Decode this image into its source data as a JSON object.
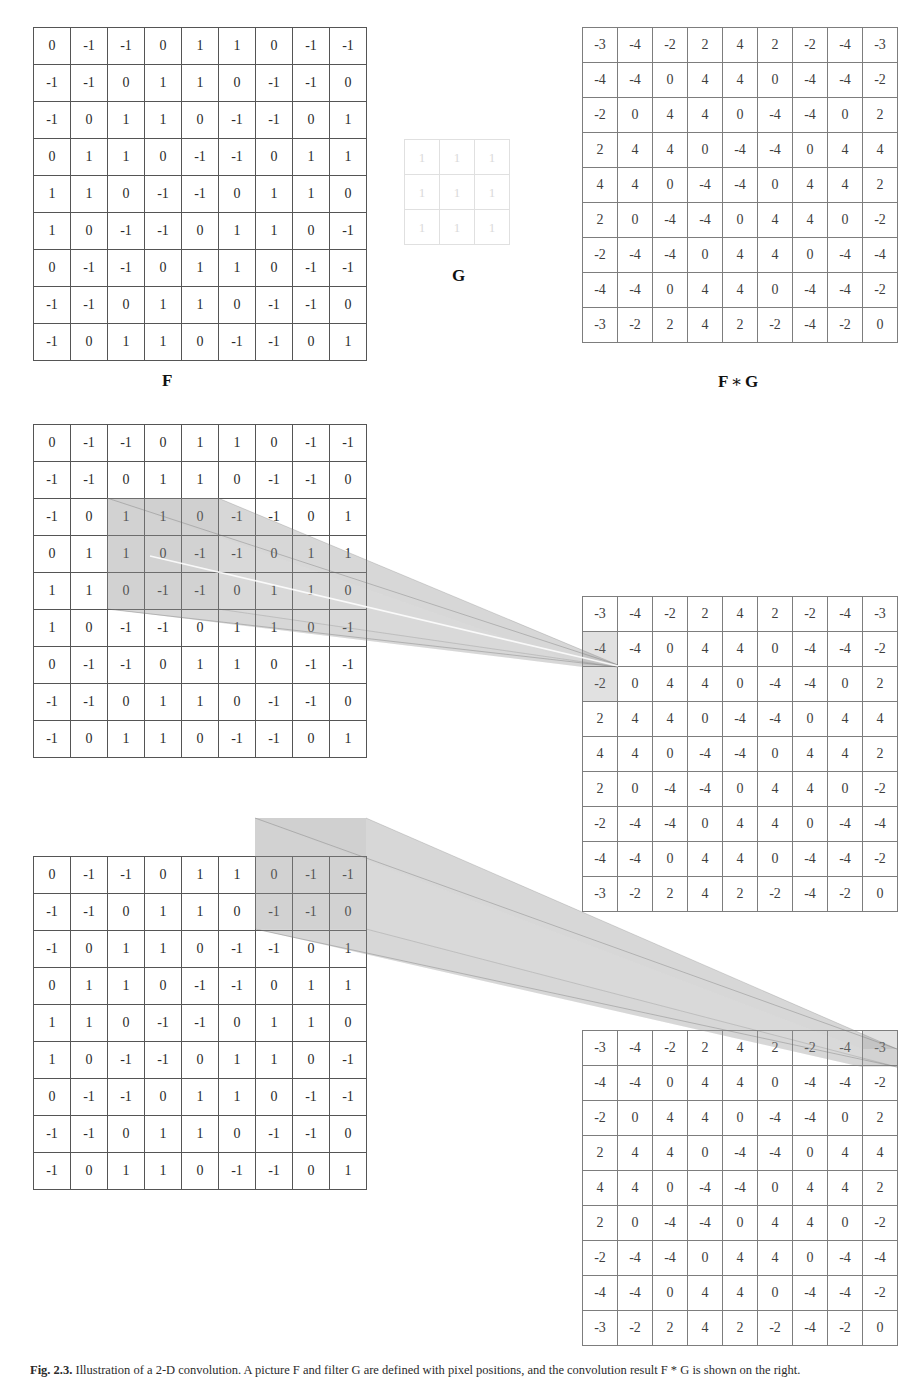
{
  "figure": {
    "kind": "2d-convolution-illustration",
    "caption_tag": "Fig. 2.3.",
    "caption_text": "Illustration of a 2-D convolution. A picture F and filter G are defined with pixel positions, and the convolution result F * G is shown on the right.",
    "labels": {
      "input": "F",
      "kernel": "G",
      "result_left": "F",
      "result_op": "∗",
      "result_right": "G"
    }
  },
  "matrices": {
    "F": {
      "name": "F",
      "rows": 9,
      "cols": 9,
      "values": [
        [
          "0",
          "-1",
          "-1",
          "0",
          "1",
          "1",
          "0",
          "-1",
          "-1"
        ],
        [
          "-1",
          "-1",
          "0",
          "1",
          "1",
          "0",
          "-1",
          "-1",
          "0"
        ],
        [
          "-1",
          "0",
          "1",
          "1",
          "0",
          "-1",
          "-1",
          "0",
          "1"
        ],
        [
          "0",
          "1",
          "1",
          "0",
          "-1",
          "-1",
          "0",
          "1",
          "1"
        ],
        [
          "1",
          "1",
          "0",
          "-1",
          "-1",
          "0",
          "1",
          "1",
          "0"
        ],
        [
          "1",
          "0",
          "-1",
          "-1",
          "0",
          "1",
          "1",
          "0",
          "-1"
        ],
        [
          "0",
          "-1",
          "-1",
          "0",
          "1",
          "1",
          "0",
          "-1",
          "-1"
        ],
        [
          "-1",
          "-1",
          "0",
          "1",
          "1",
          "0",
          "-1",
          "-1",
          "0"
        ],
        [
          "-1",
          "0",
          "1",
          "1",
          "0",
          "-1",
          "-1",
          "0",
          "1"
        ]
      ]
    },
    "G": {
      "name": "G",
      "rows": 3,
      "cols": 3,
      "values": [
        [
          "1",
          "1",
          "1"
        ],
        [
          "1",
          "1",
          "1"
        ],
        [
          "1",
          "1",
          "1"
        ]
      ]
    },
    "FG": {
      "name": "F * G",
      "rows": 9,
      "cols": 9,
      "values": [
        [
          "-3",
          "-4",
          "-2",
          "2",
          "4",
          "2",
          "-2",
          "-4",
          "-3"
        ],
        [
          "-4",
          "-4",
          "0",
          "4",
          "4",
          "0",
          "-4",
          "-4",
          "-2"
        ],
        [
          "-2",
          "0",
          "4",
          "4",
          "0",
          "-4",
          "-4",
          "0",
          "2"
        ],
        [
          "2",
          "4",
          "4",
          "0",
          "-4",
          "-4",
          "0",
          "4",
          "4"
        ],
        [
          "4",
          "4",
          "0",
          "-4",
          "-4",
          "0",
          "4",
          "4",
          "2"
        ],
        [
          "2",
          "0",
          "-4",
          "-4",
          "0",
          "4",
          "4",
          "0",
          "-2"
        ],
        [
          "-2",
          "-4",
          "-4",
          "0",
          "4",
          "4",
          "0",
          "-4",
          "-4"
        ],
        [
          "-4",
          "-4",
          "0",
          "4",
          "4",
          "0",
          "-4",
          "-4",
          "-2"
        ],
        [
          "-3",
          "-2",
          "2",
          "4",
          "2",
          "-2",
          "-4",
          "-2",
          "0"
        ]
      ]
    }
  },
  "panels": {
    "top": {
      "id": "panel-definition",
      "input_label": "F",
      "kernel_label": "G",
      "result_label": "F ∗ G"
    },
    "middle": {
      "id": "panel-interior-window",
      "window": {
        "description": "3x3 neighbourhood centred on interior pixel",
        "row_start": 3,
        "row_end": 5,
        "col_start": 3,
        "col_end": 5
      },
      "target_cell": {
        "row": 3,
        "col": 1,
        "value": "2"
      }
    },
    "bottom": {
      "id": "panel-border-window",
      "window": {
        "description": "3x3 neighbourhood centred on border pixel, partly outside the image",
        "row_start": 0,
        "row_end": 2,
        "col_start": 8,
        "col_end": 10
      },
      "target_cell": {
        "row": 1,
        "col": 9,
        "value": "-3"
      }
    }
  },
  "colors": {
    "grid_line": "#6e6e6e",
    "grid_line_light": "#7d7d7d",
    "kernel_line": "#e0e0e0",
    "kernel_text": "#dadada",
    "highlight": "rgba(140,140,140,0.26)",
    "cone_fill": "rgba(150,150,150,0.22)",
    "cone_edge": "rgba(110,110,110,0.45)",
    "text": "#2a2a2a",
    "background": "#ffffff"
  }
}
